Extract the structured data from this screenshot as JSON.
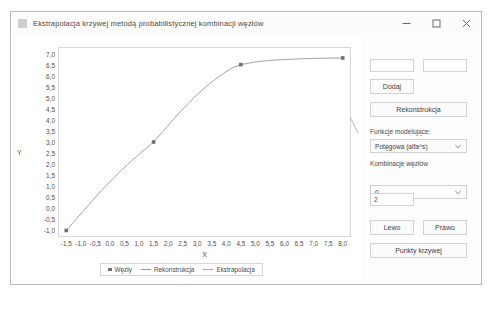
{
  "window": {
    "title": "Ekstrapolacja krzywej metodą probabilistycznej kombinacji węzłów",
    "icon": "app-icon",
    "minimize_label": "minimize-icon",
    "maximize_label": "maximize-icon",
    "close_label": "close-icon"
  },
  "controls": {
    "input_x": "",
    "input_x_placeholder": "",
    "input_y": "",
    "input_y_placeholder": "",
    "add_label": "Dodaj",
    "reconstruct_label": "Rekonstrukcja",
    "model_functions_label": "Funkcje modelujące:",
    "model_functions_value": "Potęgowa (alfa^s)",
    "node_combinations_label": "Kombinacje węzłów",
    "node_combinations_value": "0",
    "count_value": "2",
    "left_label": "Lewo",
    "right_label": "Prawo",
    "curve_points_label": "Punkty krzywej"
  },
  "chart_data": {
    "type": "line",
    "title": "",
    "xlabel": "X",
    "ylabel": "Y",
    "xlim": [
      -1.75,
      8.25
    ],
    "ylim": [
      -1.25,
      7.25
    ],
    "grid": false,
    "legend_position": "bottom",
    "xticks": [
      "-1,5",
      "-1,0",
      "-0,5",
      "0,0",
      "0,5",
      "1,0",
      "1,5",
      "2,0",
      "2,5",
      "3,0",
      "3,5",
      "4,0",
      "4,5",
      "5,0",
      "5,5",
      "6,0",
      "6,5",
      "7,0",
      "7,5",
      "8,0"
    ],
    "xtick_values": [
      -1.5,
      -1.0,
      -0.5,
      0.0,
      0.5,
      1.0,
      1.5,
      2.0,
      2.5,
      3.0,
      3.5,
      4.0,
      4.5,
      5.0,
      5.5,
      6.0,
      6.5,
      7.0,
      7.5,
      8.0
    ],
    "yticks": [
      "7,0",
      "6,5",
      "6,0",
      "5,5",
      "5,0",
      "4,5",
      "4,0",
      "3,5",
      "3,0",
      "2,5",
      "2,0",
      "1,5",
      "1,0",
      "0,5",
      "0,0",
      "-0,5",
      "-1,0"
    ],
    "ytick_values": [
      7.0,
      6.5,
      6.0,
      5.5,
      5.0,
      4.5,
      4.0,
      3.5,
      3.0,
      2.5,
      2.0,
      1.5,
      1.0,
      0.5,
      0.0,
      -0.5,
      -1.0
    ],
    "legend": [
      {
        "name": "Węzły",
        "marker": "square"
      },
      {
        "name": "Rekonstrukcja",
        "marker": "line"
      },
      {
        "name": "Ekstrapolacja",
        "marker": "dashed-line"
      }
    ],
    "series": [
      {
        "name": "Węzły",
        "type": "scatter",
        "points": [
          {
            "x": -1.5,
            "y": -1.0
          },
          {
            "x": 1.5,
            "y": 3.0
          },
          {
            "x": 4.5,
            "y": 6.5
          },
          {
            "x": 8.0,
            "y": 6.8
          }
        ]
      },
      {
        "name": "Rekonstrukcja",
        "type": "line",
        "points": [
          {
            "x": -1.5,
            "y": -1.0
          },
          {
            "x": -1.2,
            "y": -0.55
          },
          {
            "x": -0.9,
            "y": -0.1
          },
          {
            "x": -0.6,
            "y": 0.35
          },
          {
            "x": -0.3,
            "y": 0.8
          },
          {
            "x": 0.0,
            "y": 1.2
          },
          {
            "x": 0.3,
            "y": 1.6
          },
          {
            "x": 0.6,
            "y": 1.98
          },
          {
            "x": 0.9,
            "y": 2.32
          },
          {
            "x": 1.2,
            "y": 2.66
          },
          {
            "x": 1.5,
            "y": 3.0
          },
          {
            "x": 1.8,
            "y": 3.45
          },
          {
            "x": 2.1,
            "y": 3.9
          },
          {
            "x": 2.4,
            "y": 4.35
          },
          {
            "x": 2.7,
            "y": 4.75
          },
          {
            "x": 3.0,
            "y": 5.15
          },
          {
            "x": 3.3,
            "y": 5.5
          },
          {
            "x": 3.6,
            "y": 5.82
          },
          {
            "x": 3.9,
            "y": 6.1
          },
          {
            "x": 4.2,
            "y": 6.35
          },
          {
            "x": 4.5,
            "y": 6.5
          }
        ]
      },
      {
        "name": "Ekstrapolacja",
        "type": "line",
        "points": [
          {
            "x": 4.5,
            "y": 6.5
          },
          {
            "x": 5.0,
            "y": 6.62
          },
          {
            "x": 5.5,
            "y": 6.69
          },
          {
            "x": 6.0,
            "y": 6.73
          },
          {
            "x": 6.5,
            "y": 6.76
          },
          {
            "x": 7.0,
            "y": 6.78
          },
          {
            "x": 7.5,
            "y": 6.79
          },
          {
            "x": 8.0,
            "y": 6.8
          }
        ]
      }
    ]
  },
  "colors": {
    "line": "#9a9a9a",
    "marker": "#6f6f6f",
    "frame": "#d8d8d8",
    "text": "#4a4a4a",
    "window_border": "#b9b9b9"
  }
}
